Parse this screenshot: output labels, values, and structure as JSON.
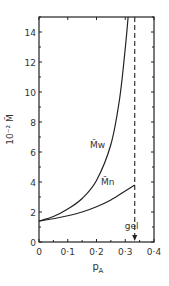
{
  "chart_data": {
    "type": "line",
    "title": "",
    "xlabel": "p_A",
    "ylabel": "10^-2 M̄",
    "xlim": [
      0,
      0.4
    ],
    "ylim": [
      0,
      15
    ],
    "xticks": [
      "0",
      "0·1",
      "0·2",
      "0·3",
      "0·4"
    ],
    "yticks": [
      "0",
      "2",
      "4",
      "6",
      "8",
      "10",
      "12",
      "14"
    ],
    "grid": false,
    "series": [
      {
        "name": "M̄w",
        "x": [
          0,
          0.05,
          0.1,
          0.15,
          0.2,
          0.25,
          0.28,
          0.3,
          0.31
        ],
        "y": [
          1.4,
          1.7,
          2.2,
          2.9,
          4.1,
          6.5,
          9.5,
          12.9,
          15
        ]
      },
      {
        "name": "M̄n",
        "x": [
          0,
          0.05,
          0.1,
          0.15,
          0.2,
          0.25,
          0.3,
          0.333
        ],
        "y": [
          1.4,
          1.55,
          1.75,
          2.0,
          2.35,
          2.8,
          3.4,
          3.8
        ]
      }
    ],
    "annotations": [
      {
        "text": "gel",
        "x": 0.333,
        "style": "dashed vertical line with arrow"
      }
    ]
  },
  "labels": {
    "mw": "M̄w",
    "mn": "M̄n",
    "gel": "gel",
    "xlabel": "p",
    "xlabel_sub": "A",
    "ylabel": "10⁻² M̄"
  }
}
